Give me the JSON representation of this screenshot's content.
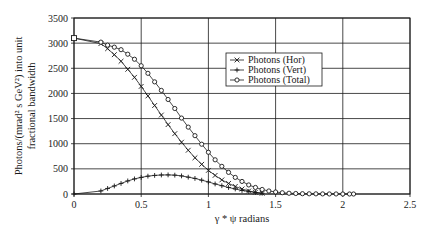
{
  "chart_data": {
    "type": "line",
    "title": "",
    "xlabel": "γ * ψ radians",
    "ylabel_line1": "Photons/(mrad² s GeV²) into unit",
    "ylabel_line2": "fractional bandwidth",
    "xlim": [
      0,
      2.5
    ],
    "ylim": [
      0,
      3500
    ],
    "x_ticks": [
      "0",
      "0.5",
      "1",
      "1.5",
      "2",
      "2.5"
    ],
    "y_ticks": [
      "0",
      "500",
      "1000",
      "1500",
      "2000",
      "2500",
      "3000",
      "3500"
    ],
    "grid": true,
    "legend_position": "upper right inside",
    "series": [
      {
        "name": "Photons (Hor)",
        "marker": "x",
        "x": [
          0,
          0.2,
          0.25,
          0.3,
          0.35,
          0.4,
          0.45,
          0.5,
          0.55,
          0.6,
          0.65,
          0.7,
          0.75,
          0.8,
          0.85,
          0.9,
          0.95,
          1.0,
          1.05,
          1.1,
          1.15,
          1.2,
          1.25,
          1.3,
          1.35,
          1.4
        ],
        "values": [
          3100,
          2990,
          2890,
          2770,
          2640,
          2480,
          2320,
          2140,
          1950,
          1760,
          1570,
          1380,
          1200,
          1030,
          870,
          720,
          590,
          470,
          370,
          280,
          210,
          150,
          100,
          60,
          35,
          15
        ]
      },
      {
        "name": "Photons (Vert)",
        "marker": "+",
        "x": [
          0,
          0.2,
          0.25,
          0.3,
          0.35,
          0.4,
          0.45,
          0.5,
          0.55,
          0.6,
          0.65,
          0.7,
          0.75,
          0.8,
          0.85,
          0.9,
          0.95,
          1.0,
          1.05,
          1.1,
          1.15,
          1.2,
          1.25,
          1.3,
          1.35,
          1.4
        ],
        "values": [
          0,
          60,
          110,
          160,
          210,
          260,
          300,
          330,
          355,
          370,
          378,
          380,
          375,
          360,
          335,
          310,
          275,
          240,
          200,
          165,
          130,
          100,
          70,
          50,
          30,
          15
        ]
      },
      {
        "name": "Photons (Total)",
        "marker": "o",
        "x": [
          0,
          0.2,
          0.25,
          0.3,
          0.35,
          0.4,
          0.45,
          0.5,
          0.55,
          0.6,
          0.65,
          0.7,
          0.75,
          0.8,
          0.85,
          0.9,
          0.95,
          1.0,
          1.05,
          1.1,
          1.15,
          1.2,
          1.25,
          1.3,
          1.35,
          1.4,
          1.45,
          1.5,
          1.55,
          1.6,
          1.65,
          1.7,
          1.75,
          1.8,
          1.85,
          1.9,
          1.95,
          2.0,
          2.05,
          2.08
        ],
        "values": [
          3100,
          3020,
          2960,
          2920,
          2870,
          2780,
          2680,
          2550,
          2400,
          2230,
          2060,
          1880,
          1700,
          1510,
          1330,
          1160,
          990,
          830,
          680,
          550,
          430,
          330,
          250,
          180,
          130,
          90,
          60,
          40,
          25,
          15,
          10,
          6,
          4,
          3,
          2,
          1,
          1,
          0,
          0,
          0
        ]
      }
    ]
  }
}
